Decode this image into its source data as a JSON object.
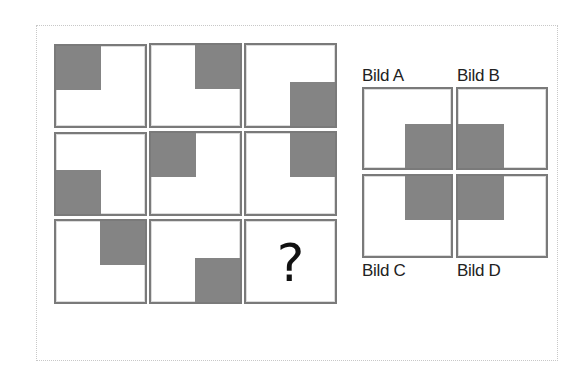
{
  "puzzle": {
    "type": "matrix-reasoning",
    "grid": {
      "rows": 3,
      "cols": 3,
      "cells": [
        {
          "row": 1,
          "col": 1,
          "shaded_corner": "top-left"
        },
        {
          "row": 1,
          "col": 2,
          "shaded_corner": "top-right"
        },
        {
          "row": 1,
          "col": 3,
          "shaded_corner": "bottom-right"
        },
        {
          "row": 2,
          "col": 1,
          "shaded_corner": "bottom-left"
        },
        {
          "row": 2,
          "col": 2,
          "shaded_corner": "top-left"
        },
        {
          "row": 2,
          "col": 3,
          "shaded_corner": "top-right"
        },
        {
          "row": 3,
          "col": 1,
          "shaded_corner": "top-right"
        },
        {
          "row": 3,
          "col": 2,
          "shaded_corner": "bottom-right"
        },
        {
          "row": 3,
          "col": 3,
          "shaded_corner": null,
          "text": "?"
        }
      ]
    },
    "options": [
      {
        "label": "Bild A",
        "shaded_corner": "bottom-right"
      },
      {
        "label": "Bild B",
        "shaded_corner": "bottom-left"
      },
      {
        "label": "Bild C",
        "shaded_corner": "top-right"
      },
      {
        "label": "Bild D",
        "shaded_corner": "top-left"
      }
    ]
  },
  "colors": {
    "shade": "#8a8a8a",
    "border": "#7a7a7a",
    "background": "#ffffff"
  }
}
